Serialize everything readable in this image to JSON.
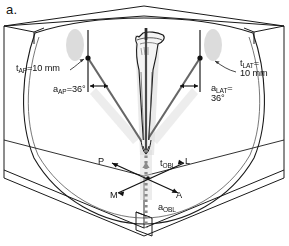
{
  "figure": {
    "panel_letter": "a.",
    "description_kind": "anatomical-diagram"
  },
  "colors": {
    "background": "#ffffff",
    "line": "#1a1a1a",
    "thin_line": "#4d4d4d",
    "shadow": "#c9c9c9",
    "bone_fill": "#f2f2f2",
    "nail": "#555555",
    "dotted_axis": "#7a7a7a"
  },
  "annotations": {
    "ap_thickness": {
      "symbol": "t",
      "subscript": "AP",
      "text": "=10 mm",
      "full": "t_AP=10 mm"
    },
    "ap_angle": {
      "symbol": "a",
      "subscript": "AP",
      "text": "=36°",
      "full": "a_AP=36°"
    },
    "lat_thickness_line1": {
      "symbol": "t",
      "subscript": "LAT",
      "text": "=",
      "full": "t_LAT="
    },
    "lat_thickness_line2": {
      "text": "10 mm"
    },
    "lat_angle_line1": {
      "symbol": "a",
      "subscript": "LAT",
      "text": "=",
      "full": "a_LAT="
    },
    "lat_angle_line2": {
      "text": "36°"
    },
    "obl_thickness": {
      "symbol": "t",
      "subscript": "OBL",
      "text": "",
      "full": "t_OBL"
    },
    "obl_angle": {
      "symbol": "a",
      "subscript": "OBL",
      "text": "",
      "full": "a_OBL"
    }
  },
  "orientation_markers": {
    "posterior": "P",
    "lateral": "L",
    "medial": "M",
    "anterior": "A"
  },
  "measurements": {
    "t_AP_mm": 10,
    "a_AP_deg": 36,
    "t_LAT_mm": 10,
    "a_LAT_deg": 36
  }
}
